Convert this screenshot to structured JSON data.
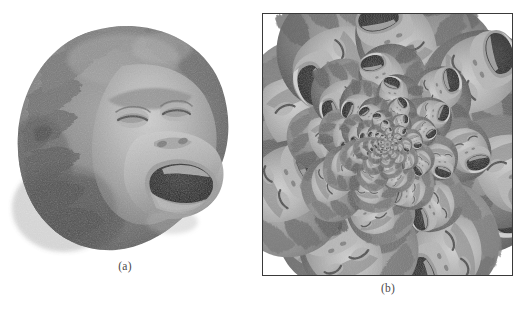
{
  "figure": {
    "background_color": "#ffffff",
    "panels": [
      {
        "id": "a",
        "caption": "(a)",
        "subject": "orangutan-head",
        "description": "Grayscale photograph of an orangutan head in three-quarter view, mouth open, tilted to the left",
        "framed": false,
        "tones": {
          "fur_mid": "#8a8a8a",
          "fur_dark": "#5c5c5c",
          "fur_shadow": "#3f3f3f",
          "face_light": "#b9b9b9",
          "face_highlight": "#d8d8d8",
          "mouth_dark": "#262626",
          "teeth": "#e2e2e2"
        }
      },
      {
        "id": "b",
        "caption": "(b)",
        "subject": "droste-kaleidoscope",
        "description": "Recursive Droste-effect spiral built from repeated copies of the orangutan head, scaling down logarithmically toward the center",
        "framed": true,
        "frame_color": "#3a3a3a",
        "frame_width_px": 1.5,
        "ring_count": 9,
        "copies_per_ring": 8,
        "scale_ratio_per_ring": 0.68,
        "rotation_per_ring_deg": 22,
        "tones": {
          "fur_mid": "#8a8a8a",
          "fur_dark": "#5c5c5c",
          "fur_shadow": "#3f3f3f",
          "face_light": "#b9b9b9",
          "face_highlight": "#d8d8d8",
          "mouth_dark": "#262626",
          "teeth": "#e2e2e2"
        }
      }
    ]
  },
  "captions": {
    "a": "(a)",
    "b": "(b)"
  }
}
